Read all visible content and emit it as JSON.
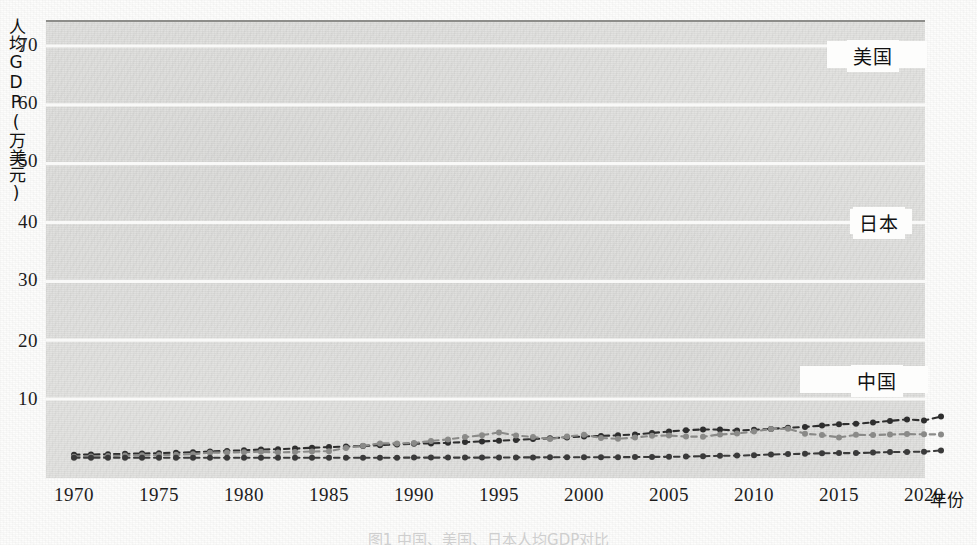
{
  "figure": {
    "caption": "图1  中国、美国、日本人均GDP对比"
  },
  "axes": {
    "y_label": "人均GDP(万美元)",
    "x_label": "年份",
    "y_ticks": [
      "10",
      "20",
      "30",
      "40",
      "50",
      "60",
      "70"
    ],
    "x_ticks": [
      "1970",
      "1975",
      "1980",
      "1985",
      "1990",
      "1995",
      "2000",
      "2005",
      "2010",
      "2015",
      "2020"
    ]
  },
  "series_labels": {
    "us": "美国",
    "japan": "日本",
    "china": "中国"
  },
  "colors": {
    "us": "#2e2e2e",
    "japan": "#8a8a88",
    "china": "#3a3a3a",
    "plot_background": "#e3e3e1",
    "gridline": "#fbfbfa",
    "axis": "#8d8d8a",
    "text": "#1c1c1c"
  },
  "chart_data": {
    "type": "line",
    "title": "",
    "xlabel": "年份",
    "ylabel": "人均GDP(万美元)",
    "xlim": [
      1970,
      2021
    ],
    "ylim": [
      0,
      73
    ],
    "yticks": [
      10,
      20,
      30,
      40,
      50,
      60,
      70
    ],
    "xticks": [
      1970,
      1975,
      1980,
      1985,
      1990,
      1995,
      2000,
      2005,
      2010,
      2015,
      2020
    ],
    "grid": "horizontal",
    "legend_position": "inline-right-of-series",
    "x": [
      1970,
      1971,
      1972,
      1973,
      1974,
      1975,
      1976,
      1977,
      1978,
      1979,
      1980,
      1981,
      1982,
      1983,
      1984,
      1985,
      1986,
      1987,
      1988,
      1989,
      1990,
      1991,
      1992,
      1993,
      1994,
      1995,
      1996,
      1997,
      1998,
      1999,
      2000,
      2001,
      2002,
      2003,
      2004,
      2005,
      2006,
      2007,
      2008,
      2009,
      2010,
      2011,
      2012,
      2013,
      2014,
      2015,
      2016,
      2017,
      2018,
      2019,
      2020,
      2021
    ],
    "series": [
      {
        "name": "美国",
        "color": "#2e2e2e",
        "values": [
          0.53,
          0.57,
          0.62,
          0.68,
          0.73,
          0.79,
          0.87,
          0.96,
          1.07,
          1.18,
          1.28,
          1.42,
          1.46,
          1.57,
          1.72,
          1.83,
          1.91,
          2.01,
          2.15,
          2.29,
          2.4,
          2.45,
          2.56,
          2.67,
          2.8,
          2.91,
          3.04,
          3.19,
          3.32,
          3.48,
          3.65,
          3.73,
          3.83,
          3.99,
          4.22,
          4.47,
          4.7,
          4.81,
          4.8,
          4.63,
          4.77,
          4.91,
          5.11,
          5.26,
          5.48,
          5.7,
          5.81,
          6.0,
          6.28,
          6.53,
          6.34,
          7.03
        ]
      },
      {
        "name": "日本",
        "color": "#8a8a88",
        "values": [
          0.2,
          0.23,
          0.3,
          0.39,
          0.43,
          0.46,
          0.52,
          0.62,
          0.87,
          0.9,
          0.95,
          1.04,
          0.91,
          1.0,
          1.07,
          1.13,
          1.68,
          2.04,
          2.45,
          2.45,
          2.52,
          2.88,
          3.13,
          3.53,
          3.85,
          4.33,
          3.79,
          3.54,
          3.19,
          3.61,
          3.94,
          3.39,
          3.24,
          3.46,
          3.75,
          3.79,
          3.61,
          3.6,
          3.98,
          4.12,
          4.5,
          4.9,
          4.95,
          4.11,
          3.88,
          3.48,
          3.92,
          3.87,
          3.96,
          4.04,
          4.0,
          3.99
        ]
      },
      {
        "name": "中国",
        "color": "#3a3a3a",
        "values": [
          0.0113,
          0.0119,
          0.0132,
          0.0157,
          0.0162,
          0.018,
          0.0166,
          0.018,
          0.0156,
          0.0184,
          0.0195,
          0.0198,
          0.0203,
          0.0225,
          0.0251,
          0.0294,
          0.0282,
          0.0252,
          0.0284,
          0.0311,
          0.0318,
          0.0333,
          0.0366,
          0.0377,
          0.0473,
          0.061,
          0.0709,
          0.0782,
          0.0828,
          0.0873,
          0.0959,
          0.1053,
          0.1148,
          0.1289,
          0.1509,
          0.1753,
          0.2099,
          0.2694,
          0.3468,
          0.3832,
          0.455,
          0.5618,
          0.6301,
          0.7051,
          0.7651,
          0.8016,
          0.8094,
          0.8817,
          0.9905,
          1.0144,
          1.0409,
          1.2556
        ]
      }
    ],
    "note": "Y values in 万美元 (10,000 USD). Curves rendered with dashed connectors and round markers."
  }
}
